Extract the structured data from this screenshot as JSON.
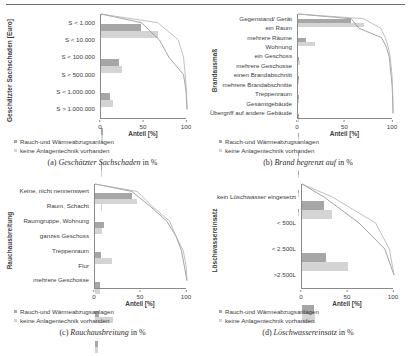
{
  "figure": {
    "legend": {
      "series1_label": "Rauch-und Wärmeabzugsanlagen",
      "series2_label": "keine Anlagentechnik vorhanden",
      "series1_color": "#a6a6a6",
      "series2_color": "#d4d4d4"
    },
    "xlabel": "Anteil [%]",
    "xticks": [
      "0",
      "50",
      "100"
    ]
  },
  "panels": [
    {
      "caption_label": "(a)",
      "caption_title": "Geschätzter Sachschaden",
      "caption_tail": "in %",
      "ylabel": "Geschätzter Sachschaden [Euro]"
    },
    {
      "caption_label": "(b)",
      "caption_title": "Brand begrenzt auf",
      "caption_tail": "in %",
      "ylabel": "Brandausmaß"
    },
    {
      "caption_label": "(c)",
      "caption_title": "Rauchausbreitung",
      "caption_tail": "in %",
      "ylabel": "Rauchausbreitung"
    },
    {
      "caption_label": "(d)",
      "caption_title": "Löschwassereinsatz",
      "caption_tail": "in %",
      "ylabel": "Löschwassereinsatz"
    }
  ],
  "chart_data": [
    {
      "type": "bar",
      "orientation": "horizontal",
      "title": "Geschätzter Sachschaden in %",
      "ylabel": "Geschätzter Sachschaden [Euro]",
      "xlabel": "Anteil [%]",
      "xlim": [
        0,
        100
      ],
      "xticks": [
        0,
        50,
        100
      ],
      "grid": false,
      "legend_position": "below",
      "categories": [
        "S < 1.000",
        "S < 10.000",
        "S < 100.000",
        "S < 500.000",
        "S < 1.000.000",
        "S > 1.000.000"
      ],
      "series": [
        {
          "name": "Rauch-und Wärmeabzugsanlagen",
          "values": [
            47,
            21,
            11,
            2,
            0.6,
            0.4
          ]
        },
        {
          "name": "keine Anlagentechnik vorhanden",
          "values": [
            66,
            24,
            14,
            2,
            0.5,
            0.3
          ]
        }
      ],
      "cumulative_curves": [
        {
          "name": "Rauch-und Wärmeabzugsanlagen",
          "values": [
            47,
            68,
            79,
            96,
            99,
            100
          ]
        },
        {
          "name": "keine Anlagentechnik vorhanden",
          "values": [
            66,
            90,
            96,
            98,
            99.5,
            100
          ]
        }
      ]
    },
    {
      "type": "bar",
      "orientation": "horizontal",
      "title": "Brand begrenzt auf in %",
      "ylabel": "Brandausmaß",
      "xlabel": "Anteil [%]",
      "xlim": [
        0,
        100
      ],
      "xticks": [
        0,
        50,
        100
      ],
      "grid": false,
      "legend_position": "below",
      "categories": [
        "Gegenstand/ Gerät",
        "ein Raum",
        "mehrere Räume",
        "Wohnung",
        "ein Geschoss",
        "mehrere Geschosse",
        "einen Brandabschnitt",
        "mehrere Brandabschnitte",
        "Treppenraum",
        "Gesamtgebäude",
        "Übergriff auf andere Gebäude"
      ],
      "series": [
        {
          "name": "Rauch-und Wärmeabzugsanlagen",
          "values": [
            56,
            8,
            1.5,
            1,
            1,
            0.8,
            0.6,
            0.4,
            0.3,
            0.3,
            0.2
          ]
        },
        {
          "name": "keine Anlagentechnik vorhanden",
          "values": [
            69,
            18,
            2,
            1.5,
            1,
            0.8,
            0.5,
            0.4,
            0.3,
            0.2,
            0.2
          ]
        }
      ],
      "cumulative_curves": [
        {
          "name": "Rauch-und Wärmeabzugsanlagen",
          "values": [
            56,
            64,
            88,
            93,
            96,
            97,
            98,
            99,
            99.5,
            99.8,
            100
          ]
        },
        {
          "name": "keine Anlagentechnik vorhanden",
          "values": [
            69,
            87,
            92,
            95,
            97,
            98,
            99,
            99.4,
            99.7,
            99.9,
            100
          ]
        }
      ]
    },
    {
      "type": "bar",
      "orientation": "horizontal",
      "title": "Rauchausbreitung in %",
      "ylabel": "Rauchausbreitung",
      "xlabel": "Anteil [%]",
      "xlim": [
        0,
        100
      ],
      "xticks": [
        0,
        50,
        100
      ],
      "grid": false,
      "legend_position": "below",
      "categories": [
        "Keine, nicht nennenswert",
        "Raum, Schacht",
        "Raumgruppe, Wohnung",
        "ganzes Geschoss",
        "Treppenraum",
        "Flur",
        "mehrere Geschosse"
      ],
      "series": [
        {
          "name": "Rauch-und Wärmeabzugsanlagen",
          "values": [
            40,
            10,
            7,
            5,
            4,
            3,
            3
          ]
        },
        {
          "name": "keine Anlagentechnik vorhanden",
          "values": [
            46,
            8,
            19,
            5,
            20,
            3,
            1
          ]
        }
      ],
      "cumulative_curves": [
        {
          "name": "Rauch-und Wärmeabzugsanlagen",
          "values": [
            40,
            60,
            78,
            88,
            94,
            97,
            100
          ]
        },
        {
          "name": "keine Anlagentechnik vorhanden",
          "values": [
            46,
            62,
            81,
            88,
            96,
            99,
            100
          ]
        }
      ]
    },
    {
      "type": "bar",
      "orientation": "horizontal",
      "title": "Löschwassereinsatz in %",
      "ylabel": "Löschwassereinsatz",
      "xlabel": "Anteil [%]",
      "xlim": [
        0,
        100
      ],
      "xticks": [
        0,
        50,
        100
      ],
      "grid": false,
      "legend_position": "below",
      "categories": [
        "kein Löschwasser eingesetzt",
        "< 500L",
        "< 2.500L",
        ">2.500L"
      ],
      "series": [
        {
          "name": "Rauch-und Wärmeabzugsanlagen",
          "values": [
            24,
            26,
            13,
            6
          ]
        },
        {
          "name": "keine Anlagentechnik vorhanden",
          "values": [
            33,
            50,
            14,
            5
          ]
        }
      ],
      "cumulative_curves": [
        {
          "name": "Rauch-und Wärmeabzugsanlagen",
          "values": [
            24,
            62,
            90,
            100
          ]
        },
        {
          "name": "keine Anlagentechnik vorhanden",
          "values": [
            33,
            80,
            95,
            100
          ]
        }
      ]
    }
  ]
}
